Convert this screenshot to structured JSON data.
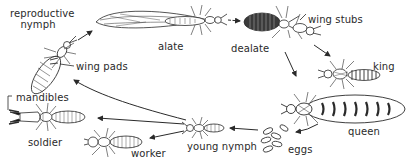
{
  "diagram": {
    "colors": {
      "ink": "#2a2a2a",
      "background": "#ffffff"
    },
    "labels": {
      "reproductive_nymph_line1": "reproductive",
      "reproductive_nymph_line2": "nymph",
      "wing_pads": "wing pads",
      "alate": "alate",
      "dealate": "dealate",
      "wing_stubs": "wing stubs",
      "king": "king",
      "queen": "queen",
      "eggs": "eggs",
      "young_nymph": "young nymph",
      "worker": "worker",
      "soldier": "soldier",
      "mandibles": "mandibles"
    },
    "stages": [
      {
        "id": "eggs",
        "label": "eggs"
      },
      {
        "id": "young-nymph",
        "label": "young nymph"
      },
      {
        "id": "worker",
        "label": "worker"
      },
      {
        "id": "soldier",
        "label": "soldier"
      },
      {
        "id": "reproductive-nymph",
        "label": "reproductive nymph"
      },
      {
        "id": "alate",
        "label": "alate"
      },
      {
        "id": "dealate",
        "label": "dealate"
      },
      {
        "id": "king",
        "label": "king"
      },
      {
        "id": "queen",
        "label": "queen"
      }
    ],
    "arrows": [
      {
        "from": "reproductive-nymph",
        "to": "alate"
      },
      {
        "from": "alate",
        "to": "dealate"
      },
      {
        "from": "dealate",
        "to": "king"
      },
      {
        "from": "dealate",
        "to": "queen"
      },
      {
        "from": "queen",
        "to": "eggs"
      },
      {
        "from": "eggs",
        "to": "young-nymph"
      },
      {
        "from": "young-nymph",
        "to": "worker"
      },
      {
        "from": "young-nymph",
        "to": "soldier"
      },
      {
        "from": "young-nymph",
        "to": "reproductive-nymph"
      }
    ]
  }
}
